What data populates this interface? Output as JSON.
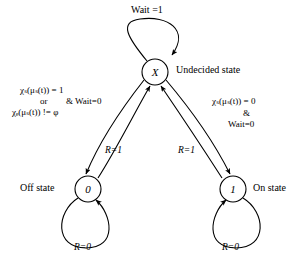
{
  "diagram": {
    "type": "state-transition-diagram",
    "stroke_color": "#000000",
    "background": "#ffffff"
  },
  "states": [
    {
      "id": "undecided",
      "label": "X",
      "caption": "Undecided state",
      "cx": 155,
      "cy": 72,
      "r": 13
    },
    {
      "id": "off",
      "label": "0",
      "caption": "Off state",
      "cx": 88,
      "cy": 189,
      "r": 13
    },
    {
      "id": "on",
      "label": "1",
      "caption": "On state",
      "cx": 233,
      "cy": 189,
      "r": 13
    }
  ],
  "self_loops": [
    {
      "id": "undecided-wait-loop",
      "from": "undecided",
      "to": "undecided",
      "label": "Wait =1"
    },
    {
      "id": "off-r0-loop",
      "from": "off",
      "to": "off",
      "label": "R=0"
    },
    {
      "id": "on-r0-loop",
      "from": "on",
      "to": "on",
      "label": "R=0"
    }
  ],
  "transitions": [
    {
      "id": "undecided-to-off",
      "from": "undecided",
      "to": "off",
      "guard_lines": [
        {
          "chi": "χ",
          "chi_sub": "s",
          "mu": "μ",
          "mu_sub": "s",
          "arg": "t",
          "op": "=",
          "value": "1"
        },
        {
          "text": "or"
        },
        {
          "chi": "χ",
          "chi_sub": "c",
          "mu": "μ",
          "mu_sub": "s",
          "arg": "t",
          "op": "!=",
          "value": "φ"
        }
      ],
      "guard_suffix": "& Wait=0"
    },
    {
      "id": "undecided-to-on",
      "from": "undecided",
      "to": "on",
      "guard_lines": [
        {
          "chi": "χ",
          "chi_sub": "s",
          "mu": "μ",
          "mu_sub": "s",
          "arg": "t",
          "op": "=",
          "value": "0"
        },
        {
          "text": "&"
        },
        {
          "text": "Wait=0"
        }
      ]
    },
    {
      "id": "off-to-undecided",
      "from": "off",
      "to": "undecided",
      "label": "R=1"
    },
    {
      "id": "on-to-undecided",
      "from": "on",
      "to": "undecided",
      "label": "R=1"
    }
  ],
  "labels": {
    "wait_loop": "Wait =1",
    "undecided_caption": "Undecided state",
    "off_caption": "Off state",
    "on_caption": "On state",
    "and_wait_zero": "& Wait=0",
    "amp": "&",
    "wait_zero": "Wait=0",
    "or": "or",
    "r_equals_one_left": "R=1",
    "r_equals_one_right": "R=1",
    "r_equals_zero_left": "R=0",
    "r_equals_zero_right": "R=0",
    "state_x": "X",
    "state_zero": "0",
    "state_one": "1",
    "guard_left_line1": "χₛ(μₛ(t)) = 1",
    "guard_left_line3": "χₑ(μₛ(t)) != φ",
    "guard_right_line1": "χₛ(μₛ(t)) = 0"
  }
}
